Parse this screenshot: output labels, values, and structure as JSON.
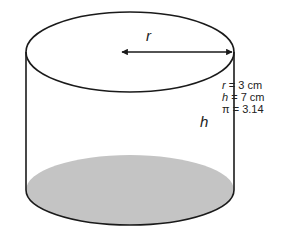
{
  "diagram": {
    "shape": "cylinder",
    "labels": {
      "radius": "r",
      "height": "h"
    },
    "given": [
      {
        "var": "r",
        "rest": " = 3 cm"
      },
      {
        "var": "h",
        "rest": " = 7 cm"
      },
      {
        "var": "π",
        "rest": " = 3.14"
      }
    ],
    "colors": {
      "stroke": "#1a1a1a",
      "base_fill": "#c4c4c4",
      "background": "#ffffff"
    }
  }
}
